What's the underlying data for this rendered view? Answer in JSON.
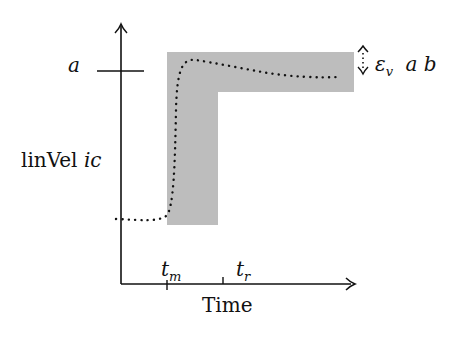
{
  "diagram": {
    "type": "step-response tolerance band",
    "y_axis": {
      "label": "linVel ic",
      "label_parts": [
        "linVel",
        "ic"
      ],
      "tick_label": "a"
    },
    "x_axis": {
      "label": "Time",
      "ticks": [
        {
          "name": "t",
          "sub": "m"
        },
        {
          "name": "t",
          "sub": "r"
        }
      ]
    },
    "band_annotation": {
      "symbol": "ε",
      "sub": "v",
      "args": "a b"
    },
    "colors": {
      "band": "#bdbdbd",
      "axes": "#111111",
      "curve": "#111111"
    }
  }
}
